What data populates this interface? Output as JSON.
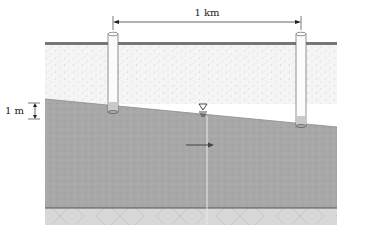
{
  "diagram": {
    "type": "aquifer-cross-section",
    "labels": {
      "horizontal_distance": "1 km",
      "vertical_drop": "1 m"
    },
    "symbols": {
      "water_table": "water-table-triangle-icon",
      "flow_direction": "arrow-right-icon"
    },
    "layers": [
      {
        "name": "unsaturated zone",
        "color": "#f4f4f4"
      },
      {
        "name": "saturated aquifer",
        "color": "#a6a6a6"
      },
      {
        "name": "impermeable bedrock",
        "color": "#d6d6d6"
      }
    ],
    "wells": [
      {
        "name": "well-left"
      },
      {
        "name": "well-right"
      }
    ],
    "colors": {
      "ground_surface": "#6f6f6f",
      "aquifer_base": "#555555",
      "dimension_line": "#222222"
    }
  }
}
